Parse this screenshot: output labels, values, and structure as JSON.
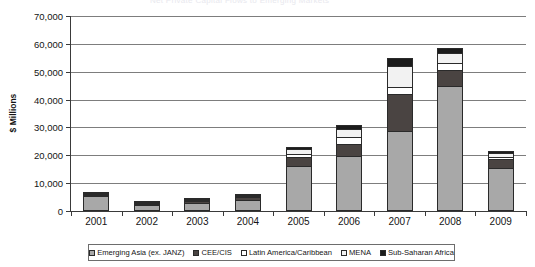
{
  "clipped_title": "Net Private Capital Flows to Emerging Markets",
  "axis": {
    "y_title": "$ Millions",
    "y_ticks": [
      "70,000",
      "60,000",
      "50,000",
      "40,000",
      "30,000",
      "20,000",
      "10,000",
      "0"
    ]
  },
  "chart_data": {
    "type": "bar",
    "stacked": true,
    "title": "",
    "subtitle": "",
    "xlabel": "",
    "ylabel": "$ Millions",
    "ylim": [
      0,
      70000
    ],
    "ytick_step": 10000,
    "grid": true,
    "legend_position": "bottom",
    "categories": [
      "2001",
      "2002",
      "2003",
      "2004",
      "2005",
      "2006",
      "2007",
      "2008",
      "2009"
    ],
    "series": [
      {
        "name": "Emerging Asia (ex. JANZ)",
        "color": "#a8a8a8",
        "values": [
          5300,
          2100,
          2700,
          4100,
          16300,
          19600,
          28800,
          45000,
          15600
        ]
      },
      {
        "name": "CEE/CIS",
        "color": "#4a4442",
        "values": [
          600,
          400,
          800,
          900,
          3100,
          4500,
          13300,
          5700,
          2900
        ]
      },
      {
        "name": "Latin America/Caribbean",
        "color": "#ffffff",
        "values": [
          200,
          300,
          500,
          400,
          900,
          2300,
          2400,
          2500,
          1000
        ]
      },
      {
        "name": "MENA",
        "color": "#f2f2f2",
        "values": [
          200,
          200,
          300,
          300,
          1900,
          3100,
          7400,
          3600,
          1200
        ]
      },
      {
        "name": "Sub-Saharan Africa",
        "color": "#1c1c1c",
        "values": [
          200,
          200,
          200,
          300,
          800,
          1500,
          3100,
          1700,
          800
        ]
      }
    ],
    "totals": [
      6500,
      3200,
      4500,
      6000,
      23000,
      31000,
      55000,
      58500,
      21500
    ]
  },
  "legend": {
    "items": [
      {
        "label": "Emerging Asia (ex. JANZ)",
        "color": "#a8a8a8"
      },
      {
        "label": "CEE/CIS",
        "color": "#4a4442"
      },
      {
        "label": "Latin America/Caribbean",
        "color": "#ffffff"
      },
      {
        "label": "MENA",
        "color": "#f2f2f2"
      },
      {
        "label": "Sub-Saharan Africa",
        "color": "#1c1c1c"
      }
    ]
  }
}
